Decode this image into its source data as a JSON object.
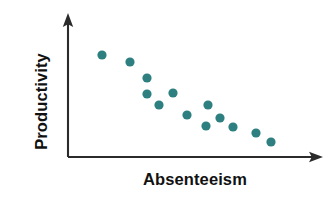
{
  "chart_data": {
    "type": "scatter",
    "title": "",
    "subtitle": "",
    "xlabel": "Absenteeism",
    "ylabel": "Productivity",
    "annotations": [],
    "legend": {
      "entries": [],
      "position": "none",
      "visible": false
    },
    "grid": false,
    "axis_ticks": {
      "x": [],
      "y": []
    },
    "axis_style": "arrow-ended schematic axes, no tick marks, no numeric scale",
    "xlim": [
      0,
      100
    ],
    "ylim": [
      0,
      100
    ],
    "relationship": "negative correlation",
    "point_color": "#2e8080",
    "axis_color": "#2b2b2b",
    "background_color": "#ffffff",
    "point_radius": 4.6,
    "n_points": 13,
    "series": [
      {
        "name": "Observations",
        "color": "#2e8080",
        "marker": "circle",
        "points": [
          {
            "x": 13.4,
            "y": 71.3
          },
          {
            "x": 24.4,
            "y": 66.4
          },
          {
            "x": 31.1,
            "y": 55.2
          },
          {
            "x": 31.1,
            "y": 44.1
          },
          {
            "x": 41.3,
            "y": 44.8
          },
          {
            "x": 35.8,
            "y": 36.4
          },
          {
            "x": 55.1,
            "y": 36.4
          },
          {
            "x": 46.9,
            "y": 29.4
          },
          {
            "x": 54.3,
            "y": 21.7
          },
          {
            "x": 64.9,
            "y": 21.0
          },
          {
            "x": 74.0,
            "y": 16.8
          },
          {
            "x": 79.9,
            "y": 10.5
          },
          {
            "x": 59.8,
            "y": 27.3
          }
        ],
        "pixel_points": [
          {
            "px": 102,
            "py": 55
          },
          {
            "px": 130,
            "py": 62
          },
          {
            "px": 147,
            "py": 78
          },
          {
            "px": 147,
            "py": 94
          },
          {
            "px": 173,
            "py": 93
          },
          {
            "px": 159,
            "py": 105
          },
          {
            "px": 208,
            "py": 105
          },
          {
            "px": 187,
            "py": 115
          },
          {
            "px": 206,
            "py": 126
          },
          {
            "px": 233,
            "py": 127
          },
          {
            "px": 256,
            "py": 133
          },
          {
            "px": 271,
            "py": 142
          },
          {
            "px": 220,
            "py": 118
          }
        ]
      }
    ]
  },
  "axes": {
    "origin": {
      "x": 68,
      "y": 157
    },
    "y_axis": {
      "x": 68,
      "y_top": 14,
      "y_bottom": 157
    },
    "x_axis": {
      "y": 157,
      "x_left": 68,
      "x_right": 322
    }
  }
}
